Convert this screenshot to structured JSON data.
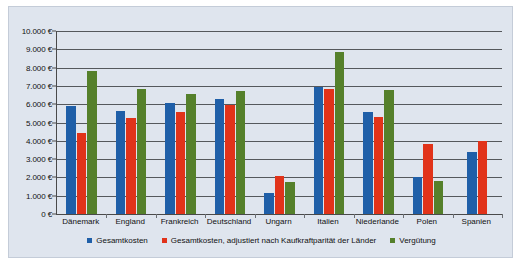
{
  "chart_data": {
    "type": "bar",
    "title": "",
    "xlabel": "",
    "ylabel": "",
    "ylim": [
      0,
      10000
    ],
    "ytick_step": 1000,
    "grid": true,
    "legend_position": "bottom",
    "currency_suffix": "€",
    "categories": [
      "Dänemark",
      "England",
      "Frankreich",
      "Deutschland",
      "Ungarn",
      "Italien",
      "Niederlande",
      "Polen",
      "Spanien"
    ],
    "ytick_labels": [
      "0 €",
      "1.000 €",
      "2.000 €",
      "3.000 €",
      "4.000 €",
      "5.000 €",
      "6.000 €",
      "7.000 €",
      "8.000 €",
      "9.000 €",
      "10.000 €"
    ],
    "ytick_values": [
      0,
      1000,
      2000,
      3000,
      4000,
      5000,
      6000,
      7000,
      8000,
      9000,
      10000
    ],
    "series": [
      {
        "name": "Gesamtkosten",
        "color": "#1f5fa8",
        "values": [
          5900,
          5650,
          6050,
          6300,
          1150,
          6950,
          5600,
          2000,
          3400
        ]
      },
      {
        "name": "Gesamtkosten, adjustiert nach Kaufkraftparität der Länder",
        "color": "#e1331a",
        "values": [
          4400,
          5250,
          5600,
          5950,
          2100,
          6850,
          5300,
          3800,
          4000
        ]
      },
      {
        "name": "Vergütung",
        "color": "#55802b",
        "values": [
          7800,
          6850,
          6550,
          6700,
          1750,
          8850,
          6800,
          1800,
          null
        ]
      }
    ]
  }
}
